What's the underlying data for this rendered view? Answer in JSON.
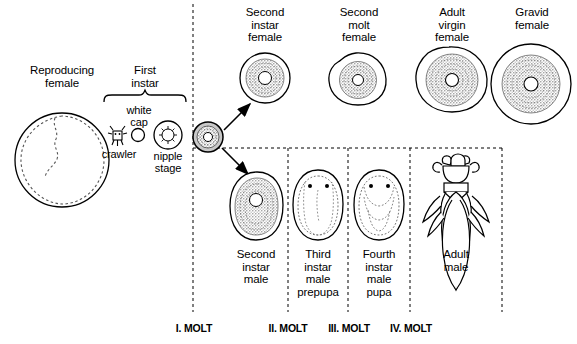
{
  "figure": {
    "type": "life-cycle-diagram",
    "background_color": "#ffffff",
    "line_color": "#000000",
    "fill_color": "#bfbfbf"
  },
  "stages": {
    "reproducing_female": {
      "label": "Reproducing\nfemale"
    },
    "first_instar": {
      "label": "First\ninstar"
    },
    "crawler": {
      "label": "crawler"
    },
    "white_cap": {
      "label": "white\ncap"
    },
    "nipple_stage": {
      "label": "nipple\nstage"
    },
    "second_instar_female": {
      "label": "Second\ninstar\nfemale"
    },
    "second_molt_female": {
      "label": "Second\nmolt\nfemale"
    },
    "adult_virgin_female": {
      "label": "Adult\nvirgin\nfemale"
    },
    "gravid_female": {
      "label": "Gravid\nfemale"
    },
    "second_instar_male": {
      "label": "Second\ninstar\nmale"
    },
    "third_instar_male_prepupa": {
      "label": "Third\ninstar\nmale\nprepupa"
    },
    "fourth_instar_male_pupa": {
      "label": "Fourth\ninstar\nmale\npupa"
    },
    "adult_male": {
      "label": "Adult\nmale"
    }
  },
  "molts": [
    {
      "id": "molt-1",
      "label": "I. MOLT"
    },
    {
      "id": "molt-2",
      "label": "II. MOLT"
    },
    {
      "id": "molt-3",
      "label": "III. MOLT"
    },
    {
      "id": "molt-4",
      "label": "IV. MOLT"
    }
  ]
}
